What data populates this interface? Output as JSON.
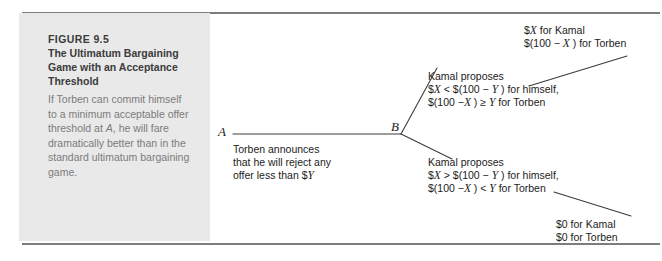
{
  "figure": {
    "number": "FIGURE 9.5",
    "title_lines": [
      "The Ultimatum Bargaining",
      "Game with an Acceptance",
      "Threshold"
    ],
    "body_lines": [
      "If Torben can commit himself",
      "to a minimum acceptable offer",
      "threshold at A, he will fare",
      "dramatically better than in the",
      "standard ultimatum bargaining",
      "game."
    ],
    "body_italic_token": "A"
  },
  "diagram": {
    "nodes": [
      {
        "id": "A",
        "label": "A",
        "x": 233,
        "y": 134
      },
      {
        "id": "B",
        "label": "B",
        "x": 402,
        "y": 134
      }
    ],
    "node_label_a": "A",
    "node_label_b": "B",
    "torben_announcement": [
      "Torben announces",
      "that he will reject any",
      "offer less than $Y"
    ],
    "kamal_proposes_accept": [
      "Kamal proposes",
      "$X < $(100 − Y ) for himself,",
      "$(100 − X ) ≥ Y for Torben"
    ],
    "kamal_proposes_reject": [
      "Kamal proposes",
      "$X > $(100 − Y ) for himself,",
      "$(100 − X ) < Y for Torben"
    ],
    "payoff_accept": [
      "$X for Kamal",
      "$(100 − X ) for Torben"
    ],
    "payoff_reject": [
      "$0 for Kamal",
      "$0 for Torben"
    ],
    "line_color": "#3c3c3c",
    "panel_color": "#e9e9e9",
    "rule_color": "#7d7d7d"
  }
}
